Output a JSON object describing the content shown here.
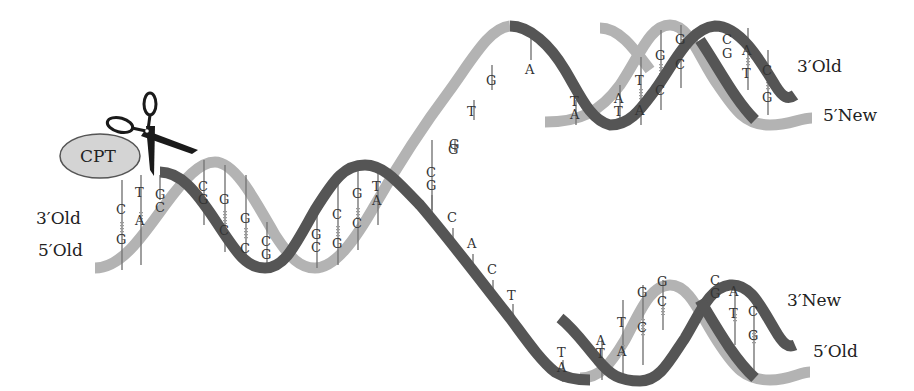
{
  "diagram": {
    "colors": {
      "dark_strand": "#555555",
      "light_strand": "#b3b3b3",
      "enzyme_fill": "#d4d4d4",
      "enzyme_stroke": "#555555",
      "scissors": "#1a1a1a",
      "text": "#222222"
    },
    "enzyme": {
      "label": "CPT"
    },
    "tool_icon": "scissors-icon",
    "strand_labels": {
      "parent_top": "3′Old",
      "parent_bottom": "5′Old",
      "upper_branch_top": "3′Old",
      "upper_branch_bottom": "5′New",
      "lower_branch_top": "3′New",
      "lower_branch_bottom": "5′Old"
    },
    "parent_pairs": [
      {
        "top": "C",
        "bottom": "G"
      },
      {
        "top": "T",
        "bottom": "A"
      },
      {
        "top": "G",
        "bottom": "C"
      },
      {
        "top": "C",
        "bottom": "G"
      },
      {
        "top": "G",
        "bottom": "C"
      },
      {
        "top": "G",
        "bottom": "C"
      },
      {
        "top": "C",
        "bottom": "G"
      },
      {
        "top": "C",
        "bottom": "G"
      },
      {
        "top": "G",
        "bottom": "C"
      },
      {
        "top": "C",
        "bottom": "G"
      },
      {
        "top": "G",
        "bottom": "C"
      },
      {
        "top": "T",
        "bottom": "A"
      },
      {
        "top": "C",
        "bottom": "G"
      }
    ],
    "upper_single_strand": [
      "G",
      "T",
      "G",
      "A"
    ],
    "lower_single_strand": [
      "C",
      "A",
      "C",
      "T"
    ],
    "fork_pair": {
      "top": "C",
      "bottom": "G"
    },
    "fork_single": "G",
    "upper_daughter_pairs": [
      {
        "top": "T",
        "bottom": "A"
      },
      {
        "top": "A",
        "bottom": "T"
      },
      {
        "top": "T",
        "bottom": "A"
      },
      {
        "top": "G",
        "bottom": "C"
      },
      {
        "top": "G",
        "bottom": "C"
      },
      {
        "top": "C",
        "bottom": "G"
      },
      {
        "top": "A",
        "bottom": "T"
      },
      {
        "top": "C",
        "bottom": "G"
      }
    ],
    "lower_daughter_pairs": [
      {
        "top": "T",
        "bottom": "A"
      },
      {
        "top": "A",
        "bottom": "T"
      },
      {
        "top": "T",
        "bottom": "A"
      },
      {
        "top": "G",
        "bottom": "C"
      },
      {
        "top": "G",
        "bottom": "C"
      },
      {
        "top": "C",
        "bottom": "G"
      },
      {
        "top": "A",
        "bottom": "T"
      },
      {
        "top": "C",
        "bottom": "G"
      }
    ]
  }
}
